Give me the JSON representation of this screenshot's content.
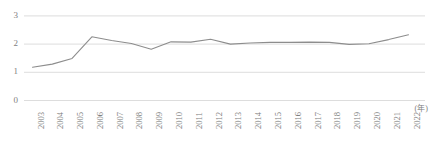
{
  "chart_data": {
    "type": "line",
    "title": "",
    "xlabel": "",
    "ylabel": "",
    "unit_label": "(年)",
    "categories": [
      "2003",
      "2004",
      "2005",
      "2006",
      "2007",
      "2008",
      "2009",
      "2010",
      "2011",
      "2012",
      "2013",
      "2014",
      "2015",
      "2016",
      "2017",
      "2018",
      "2019",
      "2020",
      "2021",
      "2022"
    ],
    "values": [
      1.18,
      1.29,
      1.49,
      2.26,
      2.13,
      2.02,
      1.82,
      2.08,
      2.07,
      2.17,
      2.0,
      2.04,
      2.06,
      2.06,
      2.07,
      2.06,
      1.99,
      2.01,
      2.16,
      2.33
    ],
    "series": [
      {
        "name": "",
        "values": [
          1.18,
          1.29,
          1.49,
          2.26,
          2.13,
          2.02,
          1.82,
          2.08,
          2.07,
          2.17,
          2.0,
          2.04,
          2.06,
          2.06,
          2.07,
          2.06,
          1.99,
          2.01,
          2.16,
          2.33
        ]
      }
    ],
    "ylim": [
      0,
      3
    ],
    "yticks": [
      0,
      1,
      2,
      3
    ],
    "ytick_labels": [
      "0",
      "1",
      "2",
      "3"
    ],
    "grid": true,
    "legend": "none",
    "line_color": "#8d8d8d",
    "grid_color": "#d9d9d9",
    "axis_text_color": "#7d7d7d"
  },
  "axes": {
    "y": {
      "ticks": [
        {
          "label": "3",
          "value": 3
        },
        {
          "label": "2",
          "value": 2
        },
        {
          "label": "1",
          "value": 1
        },
        {
          "label": "0",
          "value": 0
        }
      ]
    },
    "x": {
      "ticks": [
        {
          "label": "2003"
        },
        {
          "label": "2004"
        },
        {
          "label": "2005"
        },
        {
          "label": "2006"
        },
        {
          "label": "2007"
        },
        {
          "label": "2008"
        },
        {
          "label": "2009"
        },
        {
          "label": "2010"
        },
        {
          "label": "2011"
        },
        {
          "label": "2012"
        },
        {
          "label": "2013"
        },
        {
          "label": "2014"
        },
        {
          "label": "2015"
        },
        {
          "label": "2016"
        },
        {
          "label": "2017"
        },
        {
          "label": "2018"
        },
        {
          "label": "2019"
        },
        {
          "label": "2020"
        },
        {
          "label": "2021"
        },
        {
          "label": "2022"
        }
      ],
      "unit": "(年)"
    }
  }
}
